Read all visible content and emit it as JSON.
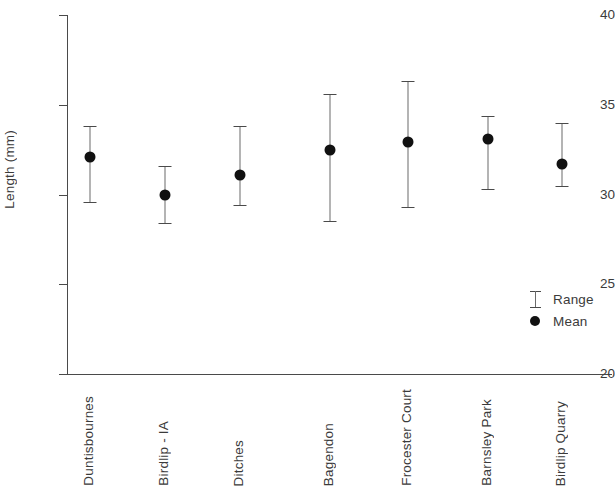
{
  "chart_data": {
    "type": "scatter",
    "title": "",
    "xlabel": "",
    "ylabel": "Length (mm)",
    "ylim": [
      20,
      40
    ],
    "yticks": [
      20,
      25,
      30,
      35,
      40
    ],
    "ytick_labels": [
      "20",
      "25",
      "30",
      "35",
      "40"
    ],
    "grid": false,
    "legend_position": "inside-bottom-right",
    "legend": [
      {
        "label": "Range",
        "symbol": "error-bar"
      },
      {
        "label": "Mean",
        "symbol": "filled-circle"
      }
    ],
    "categories": [
      "Duntisbournes",
      "Birdlip - IA",
      "Ditches",
      "Bagendon",
      "Frocester Court",
      "Barnsley Park",
      "Birdlip Quarry"
    ],
    "series": [
      {
        "name": "Mean",
        "values": [
          32.1,
          30.0,
          31.1,
          32.5,
          32.9,
          33.1,
          31.7
        ]
      },
      {
        "name": "Range",
        "lower": [
          29.6,
          28.4,
          29.4,
          28.5,
          29.3,
          30.3,
          30.5
        ],
        "upper": [
          33.8,
          31.6,
          33.8,
          35.6,
          36.3,
          34.4,
          34.0
        ]
      }
    ],
    "points": [
      {
        "category": "Duntisbournes",
        "mean": 32.1,
        "min": 29.6,
        "max": 33.8
      },
      {
        "category": "Birdlip - IA",
        "mean": 30.0,
        "min": 28.4,
        "max": 31.6
      },
      {
        "category": "Ditches",
        "mean": 31.1,
        "min": 29.4,
        "max": 33.8
      },
      {
        "category": "Bagendon",
        "mean": 32.5,
        "min": 28.5,
        "max": 35.6
      },
      {
        "category": "Frocester Court",
        "mean": 32.9,
        "min": 29.3,
        "max": 36.3
      },
      {
        "category": "Barnsley Park",
        "mean": 33.1,
        "min": 30.3,
        "max": 34.4
      },
      {
        "category": "Birdlip Quarry",
        "mean": 31.7,
        "min": 30.5,
        "max": 34.0
      }
    ],
    "colors": {
      "axis": "#4a4a4a",
      "bar": "#6b6b6b",
      "marker": "#111111",
      "text": "#3b3b3b",
      "background": "#ffffff"
    }
  }
}
